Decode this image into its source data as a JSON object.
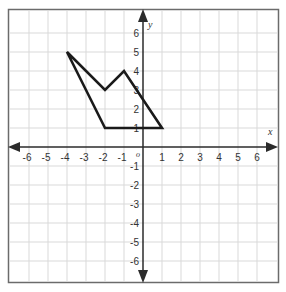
{
  "chart_data": {
    "type": "line",
    "title": "",
    "xlabel": "x",
    "ylabel": "y",
    "origin_label": "o",
    "xlim": [
      -7,
      7
    ],
    "ylim": [
      -7,
      7
    ],
    "grid": true,
    "x_ticks": [
      -6,
      -5,
      -4,
      -3,
      -2,
      -1,
      1,
      2,
      3,
      4,
      5,
      6
    ],
    "y_ticks": [
      6,
      5,
      4,
      3,
      2,
      1,
      -1,
      -2,
      -3,
      -4,
      -5,
      -6
    ],
    "series": [
      {
        "name": "polygon",
        "closed": true,
        "points": [
          [
            -4,
            5
          ],
          [
            -2,
            3
          ],
          [
            -1,
            4
          ],
          [
            1,
            1
          ],
          [
            -2,
            1
          ]
        ]
      }
    ]
  },
  "colors": {
    "grid": "#d9d9d9",
    "axis": "#2b2b2b",
    "border": "#6b6b6b",
    "shape": "#1a1a1a",
    "text": "#333333"
  }
}
